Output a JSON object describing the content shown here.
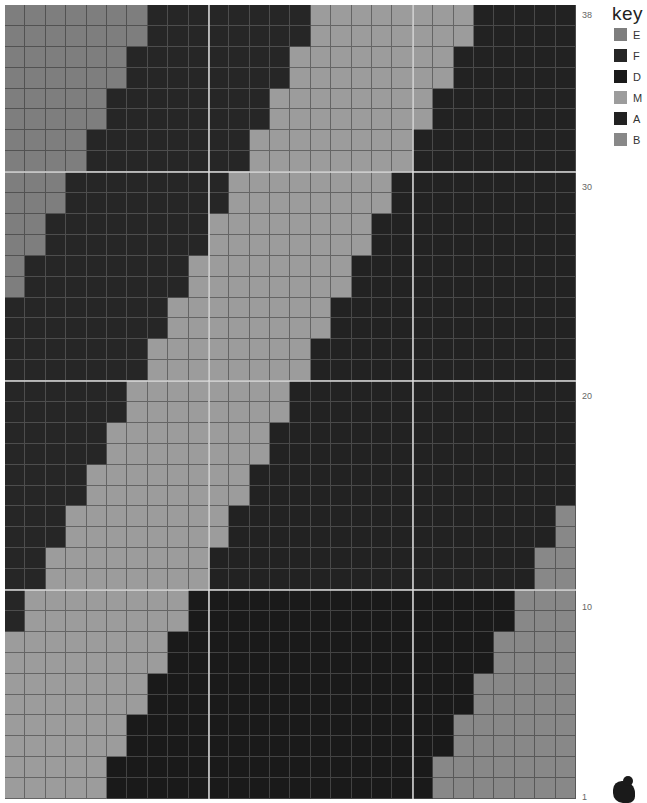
{
  "key": {
    "title": "key",
    "items": [
      {
        "code": "E",
        "label": "E",
        "color": "#7e7e7e"
      },
      {
        "code": "F",
        "label": "F",
        "color": "#262626"
      },
      {
        "code": "D",
        "label": "D",
        "color": "#1a1a1a"
      },
      {
        "code": "M",
        "label": "M",
        "color": "#9c9c9c"
      },
      {
        "code": "A",
        "label": "A",
        "color": "#222222"
      },
      {
        "code": "B",
        "label": "B",
        "color": "#888888"
      }
    ]
  },
  "grid": {
    "columns": 28,
    "rows": 38,
    "row_labels": [
      {
        "row": 38,
        "label": "38",
        "top": 10
      },
      {
        "row": 30,
        "label": "30",
        "top": 182
      },
      {
        "row": 20,
        "label": "20",
        "top": 391
      },
      {
        "row": 10,
        "label": "10",
        "top": 602
      },
      {
        "row": 1,
        "label": "1",
        "top": 792
      }
    ],
    "heavy_cols_after": [
      10,
      20
    ],
    "heavy_rows_between": [
      [
        31,
        30
      ],
      [
        21,
        20
      ],
      [
        11,
        10
      ]
    ],
    "rows_top_to_bottom": [
      {
        "row": 38,
        "runs": "E7 F8 M8 A5"
      },
      {
        "row": 37,
        "runs": "E7 F8 M8 A5"
      },
      {
        "row": 36,
        "runs": "E6 F8 M8 A6"
      },
      {
        "row": 35,
        "runs": "E6 F8 M8 A6"
      },
      {
        "row": 34,
        "runs": "E5 F8 M8 A7"
      },
      {
        "row": 33,
        "runs": "E5 F8 M8 A7"
      },
      {
        "row": 32,
        "runs": "E4 F8 M8 A8"
      },
      {
        "row": 31,
        "runs": "E4 F8 M8 A8"
      },
      {
        "row": 30,
        "runs": "E3 F8 M8 A9"
      },
      {
        "row": 29,
        "runs": "E3 F8 M8 A9"
      },
      {
        "row": 28,
        "runs": "E2 F8 M8 A10"
      },
      {
        "row": 27,
        "runs": "E2 F8 M8 A10"
      },
      {
        "row": 26,
        "runs": "E1 F8 M8 A11"
      },
      {
        "row": 25,
        "runs": "E1 F8 M8 A11"
      },
      {
        "row": 24,
        "runs": "F8 M8 A12"
      },
      {
        "row": 23,
        "runs": "F8 M8 A12"
      },
      {
        "row": 22,
        "runs": "F7 M8 A13"
      },
      {
        "row": 21,
        "runs": "F7 M8 A13"
      },
      {
        "row": 20,
        "runs": "F6 M8 A14"
      },
      {
        "row": 19,
        "runs": "F6 M8 A14"
      },
      {
        "row": 18,
        "runs": "F5 M8 A15"
      },
      {
        "row": 17,
        "runs": "F5 M8 A15"
      },
      {
        "row": 16,
        "runs": "F4 M8 A16"
      },
      {
        "row": 15,
        "runs": "F4 M8 A16"
      },
      {
        "row": 14,
        "runs": "F3 M8 A16 B1"
      },
      {
        "row": 13,
        "runs": "F3 M8 A16 B1"
      },
      {
        "row": 12,
        "runs": "F2 M8 A16 B2"
      },
      {
        "row": 11,
        "runs": "F2 M8 A16 B2"
      },
      {
        "row": 10,
        "runs": "F1 M8 D16 B3"
      },
      {
        "row": 9,
        "runs": "F1 M8 D16 B3"
      },
      {
        "row": 8,
        "runs": "M8 D16 B4"
      },
      {
        "row": 7,
        "runs": "M8 D16 B4"
      },
      {
        "row": 6,
        "runs": "M7 D16 B5"
      },
      {
        "row": 5,
        "runs": "M7 D16 B5"
      },
      {
        "row": 4,
        "runs": "M6 D16 B6"
      },
      {
        "row": 3,
        "runs": "M6 D16 B6"
      },
      {
        "row": 2,
        "runs": "M5 D16 B7"
      },
      {
        "row": 1,
        "runs": "M5 D16 B7"
      }
    ]
  }
}
